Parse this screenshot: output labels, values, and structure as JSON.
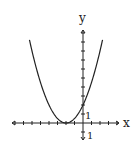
{
  "chart_data": {
    "type": "line",
    "title": "",
    "function": "y = 1/2 (x + 2)^2",
    "xlabel": "x",
    "ylabel": "y",
    "x_tick_label": "1",
    "y_tick_label": "1",
    "y_neg_tick_label": "1",
    "xlim": [
      -9,
      5
    ],
    "ylim": [
      -1,
      10
    ],
    "vertex": [
      -2,
      0
    ],
    "y_intercept": 2,
    "x": [
      -6.3,
      -6,
      -5,
      -4,
      -3,
      -2,
      -1,
      0,
      1,
      2,
      2.3
    ],
    "values": [
      9.2,
      8,
      4.5,
      2,
      0.5,
      0,
      0.5,
      2,
      4.5,
      8,
      9.2
    ],
    "grid": false
  },
  "labels": {
    "x_axis": "x",
    "y_axis": "y",
    "x_unit": "1",
    "y_unit": "1",
    "y_neg_unit": "1"
  },
  "colors": {
    "curve": "#222222",
    "axis": "#222222"
  }
}
